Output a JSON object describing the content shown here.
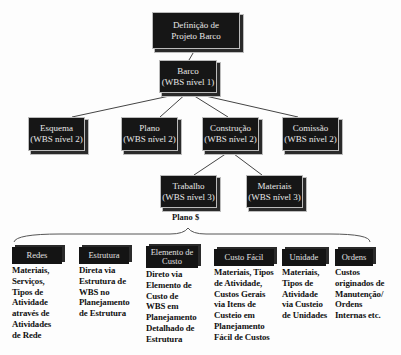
{
  "diagram": {
    "root": {
      "lines": [
        "Definição de",
        "Projeto Barco"
      ]
    },
    "level1": {
      "lines": [
        "Barco",
        "(WBS nível 1)"
      ]
    },
    "level2": [
      {
        "lines": [
          "Esquema",
          "(WBS nível 2)"
        ]
      },
      {
        "lines": [
          "Plano",
          "(WBS nível 2)"
        ]
      },
      {
        "lines": [
          "Construção",
          "(WBS nível 2)"
        ]
      },
      {
        "lines": [
          "Comissão",
          "(WBS nível 2)"
        ]
      }
    ],
    "level3": [
      {
        "lines": [
          "Trabalho",
          "(WBS nível 3)"
        ]
      },
      {
        "lines": [
          "Materiais",
          "(WBS nível 3)"
        ]
      }
    ],
    "plan_label": "Plano $",
    "categories": [
      {
        "title": [
          "Redes"
        ],
        "body": [
          "Materiais,",
          "Serviços,",
          "Tipos de",
          "Atividade",
          "através de",
          "Atividades",
          "de Rede"
        ]
      },
      {
        "title": [
          "Estrutura"
        ],
        "body": [
          "Direta via",
          "Estrutura de",
          "WBS no",
          "Planejamento",
          "de Estrutura"
        ]
      },
      {
        "title": [
          "Elemento de",
          "Custo"
        ],
        "body": [
          "Direto via",
          "Elemento de",
          "Custo de",
          "WBS em",
          "Planejamento",
          "Detalhado de",
          "Estrutura"
        ]
      },
      {
        "title": [
          "Custo Fácil"
        ],
        "body": [
          "Materiais, Tipos",
          "de Atividade,",
          "Custos Gerais",
          "via Itens de",
          "Custeio em",
          "Planejamento",
          "Fácil de Custos"
        ]
      },
      {
        "title": [
          "Unidade"
        ],
        "body": [
          "Materiais,",
          "Tipos de",
          "Atividade",
          "via Custeio",
          "de Unidades"
        ]
      },
      {
        "title": [
          "Ordens"
        ],
        "body": [
          "Custos",
          "originados de",
          "Manutenção/",
          "Ordens",
          "Internas etc."
        ]
      }
    ]
  }
}
